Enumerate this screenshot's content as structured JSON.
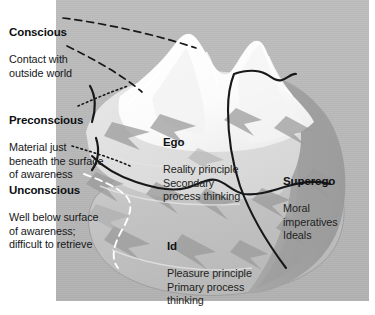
{
  "figure": {
    "background_color": "#b8b8b8",
    "page_color": "#ffffff",
    "ink_color": "#16181a"
  },
  "callouts": {
    "conscious": {
      "heading": "Conscious",
      "body": "Contact with\noutside world"
    },
    "preconscious": {
      "heading": "Preconscious",
      "body": "Material just\nbeneath the surface\nof awareness"
    },
    "unconscious": {
      "heading": "Unconscious",
      "body": "Well below surface\nof awareness;\ndifficult to retrieve"
    },
    "ego": {
      "heading": "Ego",
      "body": "Reality principle\nSecondary\nprocess thinking"
    },
    "superego": {
      "heading": "Superego",
      "body": "Moral\nimperatives\nIdeals"
    },
    "id": {
      "heading": "Id",
      "body": "Pleasure principle\nPrimary process\nthinking"
    }
  },
  "leaders": {
    "conscious_upper": "dashed-line-to-peak",
    "conscious_lower": "dashed-line-to-slope",
    "preconscious_upper": "dotted-line-to-upper-bracket",
    "preconscious_lower": "dotted-line-to-lower-bracket",
    "unconscious": "white-dashed-line-to-submerged-mass"
  },
  "graphics": {
    "waterline": "dark-curved-waterline",
    "superego_divider": "dark-dividing-line",
    "peaks": "white-snow-peaks",
    "submerged_mass": "light-gray-submerged-iceberg"
  }
}
